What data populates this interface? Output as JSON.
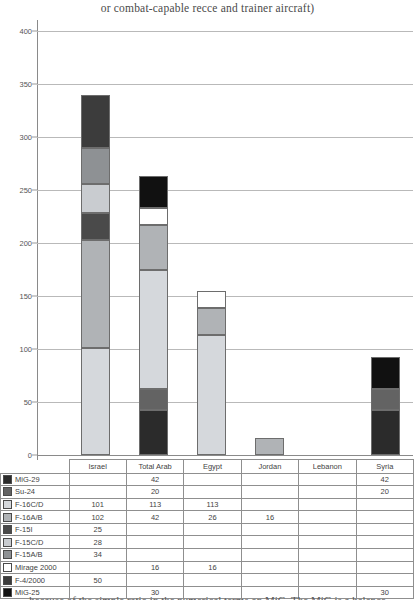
{
  "chart_data": {
    "type": "bar",
    "subtype": "stacked-bar",
    "title": "or combat-capable recce and trainer aircraft)",
    "xlabel": "",
    "ylabel": "",
    "ylim": [
      0,
      400
    ],
    "yticks": [
      0,
      50,
      100,
      150,
      200,
      250,
      300,
      350,
      400
    ],
    "ytick_labels": [
      "0",
      "50",
      "100",
      "150",
      "200",
      "250",
      "300",
      "350",
      "400"
    ],
    "grid": true,
    "legend_position": "table-left-column",
    "categories": [
      "Israel",
      "Total Arab",
      "Egypt",
      "Jordan",
      "Lebanon",
      "Syria"
    ],
    "series": [
      {
        "name": "MiG-29",
        "color": "#2b2b2b",
        "values": [
          0,
          42,
          0,
          0,
          0,
          42
        ]
      },
      {
        "name": "Su-24",
        "color": "#636363",
        "values": [
          0,
          20,
          0,
          0,
          0,
          20
        ]
      },
      {
        "name": "F-16C/D",
        "color": "#d5d8dc",
        "values": [
          101,
          113,
          113,
          0,
          0,
          0
        ]
      },
      {
        "name": "F-16A/B",
        "color": "#b0b3b6",
        "values": [
          102,
          42,
          26,
          16,
          0,
          0
        ]
      },
      {
        "name": "F-15I",
        "color": "#4a4a4a",
        "values": [
          25,
          0,
          0,
          0,
          0,
          0
        ]
      },
      {
        "name": "F-15C/D",
        "color": "#c9ccd0",
        "values": [
          28,
          0,
          0,
          0,
          0,
          0
        ]
      },
      {
        "name": "F-15A/B",
        "color": "#8e9194",
        "values": [
          34,
          0,
          0,
          0,
          0,
          0
        ]
      },
      {
        "name": "Mirage 2000",
        "color": "#ffffff",
        "values": [
          0,
          16,
          16,
          0,
          0,
          0
        ]
      },
      {
        "name": "F-4/2000",
        "color": "#3c3c3c",
        "values": [
          50,
          0,
          0,
          0,
          0,
          0
        ]
      },
      {
        "name": "MiG-25",
        "color": "#111111",
        "values": [
          0,
          30,
          0,
          0,
          0,
          30
        ]
      }
    ],
    "totals": [
      340,
      263,
      155,
      16,
      0,
      92
    ]
  },
  "table": {
    "header_blank": "",
    "columns": [
      "Israel",
      "Total Arab",
      "Egypt",
      "Jordan",
      "Lebanon",
      "Syria"
    ],
    "rows": [
      {
        "label": "MiG-29",
        "swatch": "#2b2b2b",
        "cells": [
          "",
          "42",
          "",
          "",
          "",
          "42"
        ]
      },
      {
        "label": "Su-24",
        "swatch": "#636363",
        "cells": [
          "",
          "20",
          "",
          "",
          "",
          "20"
        ]
      },
      {
        "label": "F-16C/D",
        "swatch": "#d5d8dc",
        "cells": [
          "101",
          "113",
          "113",
          "",
          "",
          ""
        ]
      },
      {
        "label": "F-16A/B",
        "swatch": "#b0b3b6",
        "cells": [
          "102",
          "42",
          "26",
          "16",
          "",
          ""
        ]
      },
      {
        "label": "F-15I",
        "swatch": "#4a4a4a",
        "cells": [
          "25",
          "",
          "",
          "",
          "",
          ""
        ]
      },
      {
        "label": "F-15C/D",
        "swatch": "#c9ccd0",
        "cells": [
          "28",
          "",
          "",
          "",
          "",
          ""
        ]
      },
      {
        "label": "F-15A/B",
        "swatch": "#8e9194",
        "cells": [
          "34",
          "",
          "",
          "",
          "",
          ""
        ]
      },
      {
        "label": "Mirage 2000",
        "swatch": "#ffffff",
        "cells": [
          "",
          "16",
          "16",
          "",
          "",
          ""
        ]
      },
      {
        "label": "F-4/2000",
        "swatch": "#3c3c3c",
        "cells": [
          "50",
          "",
          "",
          "",
          "",
          ""
        ]
      },
      {
        "label": "MiG-25",
        "swatch": "#111111",
        "cells": [
          "",
          "30",
          "",
          "",
          "",
          "30"
        ]
      }
    ]
  },
  "footer": {
    "clipped_text": "because of the simple ratio in the numerical terms on MiG. The MiG is a balance"
  }
}
